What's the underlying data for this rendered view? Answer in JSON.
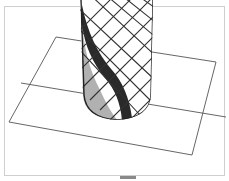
{
  "figure": {
    "caption": "",
    "colors": {
      "background": "#ffffff",
      "frame": "#cfcfcf",
      "plane_edge": "#555555",
      "lattice": "#333333",
      "band_dark": "#2a2a2a",
      "band_light": "#9a9a9a"
    }
  }
}
